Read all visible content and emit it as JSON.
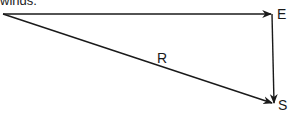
{
  "caption": {
    "text": "winds."
  },
  "diagram": {
    "type": "vector-triangle",
    "stroke_color": "#1a1a1a",
    "points": {
      "origin": {
        "x": 3,
        "y": 14
      },
      "E": {
        "x": 272,
        "y": 14
      },
      "S": {
        "x": 274,
        "y": 104
      }
    },
    "labels": {
      "E": "E",
      "S": "S",
      "R": "R"
    },
    "vectors": [
      {
        "name": "east",
        "from": "origin",
        "to": "E"
      },
      {
        "name": "south",
        "from": "E",
        "to": "S"
      },
      {
        "name": "resultant",
        "from": "origin",
        "to": "S",
        "label": "R"
      }
    ]
  }
}
